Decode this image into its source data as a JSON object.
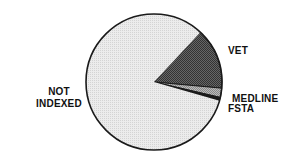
{
  "chart_data": {
    "type": "pie",
    "title": "",
    "categories": [
      "NOT INDEXED",
      "VET",
      "MEDLINE",
      "FSTA"
    ],
    "values": [
      82.5,
      14.5,
      2.2,
      0.8
    ],
    "units": "percent (estimated from slice angles)",
    "colors": {
      "NOT INDEXED": "#e6e6e6",
      "VET": "#555555",
      "MEDLINE": "#a8a8a8",
      "FSTA": "#1a1a1a"
    },
    "legend": "none (direct labels)"
  },
  "labels": {
    "not_indexed_line1": "NOT",
    "not_indexed_line2": "INDEXED",
    "vet": "VET",
    "medline": "MEDLINE",
    "fsta": "FSTA"
  }
}
